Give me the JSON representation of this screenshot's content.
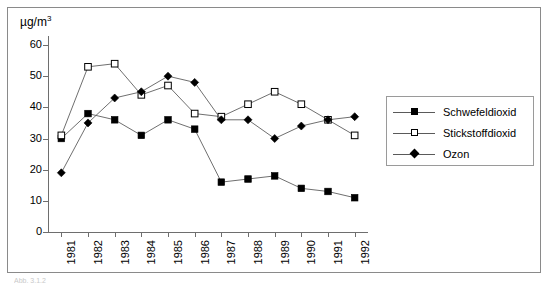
{
  "figure": {
    "unit_label": "µg/m",
    "unit_exponent": "3",
    "bottom_caption": "Abb. 3.1.2"
  },
  "axes": {
    "y_ticks": [
      0,
      10,
      20,
      30,
      40,
      50,
      60
    ],
    "y_min": 0,
    "y_max": 60,
    "x_categories": [
      "1981",
      "1982",
      "1983",
      "1984",
      "1985",
      "1986",
      "1987",
      "1988",
      "1989",
      "1990",
      "1991",
      "1992"
    ]
  },
  "legend": {
    "position": "right",
    "items": [
      {
        "label": "Schwefeldioxid",
        "marker": "filled-square",
        "color": "#000000"
      },
      {
        "label": "Stickstoffdioxid",
        "marker": "open-square",
        "color": "#000000"
      },
      {
        "label": "Ozon",
        "marker": "filled-diamond",
        "color": "#000000"
      }
    ]
  },
  "chart_data": {
    "type": "line",
    "title": "",
    "xlabel": "",
    "ylabel": "µg/m³",
    "ylim": [
      0,
      60
    ],
    "grid": false,
    "legend_position": "right",
    "categories": [
      "1981",
      "1982",
      "1983",
      "1984",
      "1985",
      "1986",
      "1987",
      "1988",
      "1989",
      "1990",
      "1991",
      "1992"
    ],
    "series": [
      {
        "name": "Schwefeldioxid",
        "marker": "filled-square",
        "color": "#000000",
        "values": [
          30,
          38,
          36,
          31,
          36,
          33,
          16,
          17,
          18,
          14,
          13,
          11
        ]
      },
      {
        "name": "Stickstoffdioxid",
        "marker": "open-square",
        "color": "#000000",
        "values": [
          31,
          53,
          54,
          44,
          47,
          38,
          37,
          41,
          45,
          41,
          36,
          31
        ]
      },
      {
        "name": "Ozon",
        "marker": "filled-diamond",
        "color": "#000000",
        "values": [
          19,
          35,
          43,
          45,
          50,
          48,
          36,
          36,
          30,
          34,
          36,
          37
        ]
      }
    ]
  }
}
